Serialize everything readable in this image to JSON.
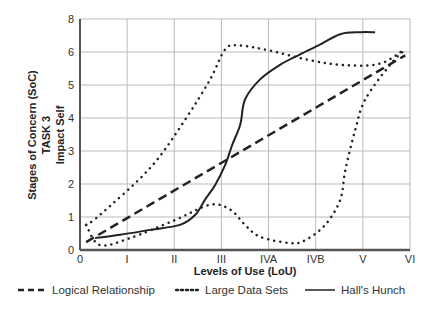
{
  "chart_data": {
    "type": "line",
    "title": "",
    "xlabel": "Levels of Use (LoU)",
    "ylabel_lines": [
      "Stages of Concern (SoC)",
      "TASK 3",
      "Impact Self"
    ],
    "x_tick_labels": [
      "0",
      "I",
      "II",
      "III",
      "IVA",
      "IVB",
      "V",
      "VI"
    ],
    "y_tick_labels": [
      "0",
      "1",
      "2",
      "3",
      "4",
      "5",
      "6",
      "8"
    ],
    "y_tick_positions": [
      0,
      1,
      2,
      3,
      4,
      5,
      6,
      7
    ],
    "xlim": [
      0,
      7
    ],
    "ylim": [
      0,
      7
    ],
    "grid": true,
    "legend_position": "bottom",
    "series": [
      {
        "name": "Logical Relationship",
        "style": "dashed",
        "x": [
          0.13,
          6.9
        ],
        "y": [
          0.24,
          5.9
        ]
      },
      {
        "name": "Large Data Sets",
        "style": "dotted",
        "note": "closed envelope: upper boundary then lower boundary",
        "x": [
          0.13,
          0.42,
          1.49,
          2.23,
          2.76,
          3.08,
          3.36,
          4.0,
          4.88,
          5.63,
          6.37,
          6.9
        ],
        "y": [
          0.76,
          1.06,
          2.49,
          3.95,
          5.17,
          6.08,
          6.2,
          6.05,
          5.75,
          5.6,
          5.65,
          6.1
        ],
        "x_lower": [
          0.42,
          1.06,
          2.02,
          2.76,
          3.19,
          3.5,
          3.82,
          4.46,
          4.78,
          5.2,
          5.52,
          5.63,
          5.84,
          6.05,
          6.58,
          6.9
        ],
        "y_lower": [
          0.15,
          0.36,
          0.91,
          1.37,
          1.22,
          0.76,
          0.4,
          0.21,
          0.3,
          0.76,
          1.52,
          2.43,
          3.65,
          4.56,
          5.62,
          6.08
        ]
      },
      {
        "name": "Hall's Hunch",
        "style": "solid",
        "x": [
          0.32,
          0.85,
          1.49,
          2.12,
          2.44,
          2.65,
          2.87,
          3.08,
          3.23,
          3.4,
          3.5,
          3.82,
          4.25,
          4.67,
          5.1,
          5.52,
          5.95,
          6.26
        ],
        "y": [
          0.36,
          0.46,
          0.61,
          0.76,
          1.06,
          1.52,
          1.98,
          2.58,
          3.19,
          3.8,
          4.56,
          5.17,
          5.62,
          5.93,
          6.23,
          6.54,
          6.6,
          6.6
        ]
      }
    ]
  },
  "legend": {
    "items": [
      {
        "label": "Logical Relationship",
        "style": "dashed"
      },
      {
        "label": "Large Data Sets",
        "style": "dotted"
      },
      {
        "label": "Hall's Hunch",
        "style": "solid"
      }
    ]
  },
  "colors": {
    "line": "#222222",
    "grid": "#bbbbbb",
    "axis": "#555555"
  }
}
